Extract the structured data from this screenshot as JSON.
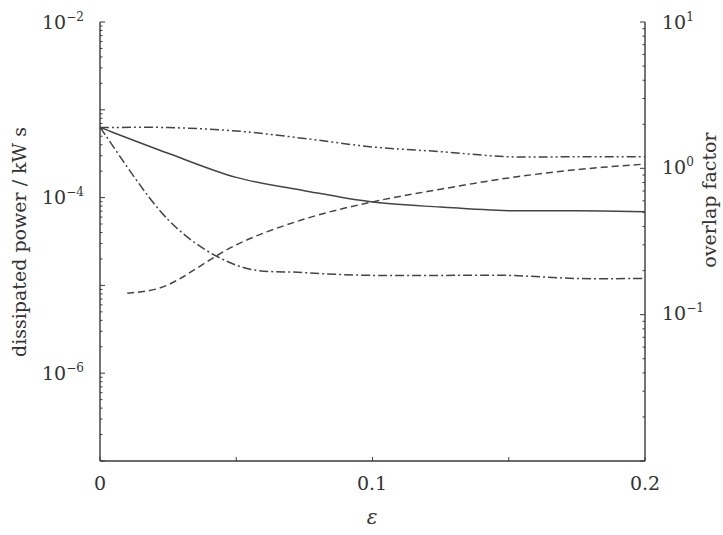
{
  "chart_data": {
    "type": "line",
    "title": "",
    "xlabel": "ε",
    "ylabel": "dissipated power / kW s",
    "ylabel_right": "overlap factor",
    "xlim": [
      0,
      0.2
    ],
    "ylim": [
      1e-07,
      0.01
    ],
    "ylim_right": [
      0.01,
      10.0
    ],
    "yscale": "log",
    "yscale_right": "log",
    "grid": false,
    "legend": null,
    "x_ticks": [
      "0",
      "0.1",
      "0.2"
    ],
    "y_ticks": [
      {
        "base": "10",
        "exp": "-2"
      },
      {
        "base": "10",
        "exp": "-4"
      },
      {
        "base": "10",
        "exp": "-6"
      }
    ],
    "y_ticks_right": [
      {
        "base": "10",
        "exp": "1"
      },
      {
        "base": "10",
        "exp": "0"
      },
      {
        "base": "10",
        "exp": "-1"
      }
    ],
    "x": [
      0,
      0.025,
      0.05,
      0.075,
      0.1,
      0.125,
      0.15,
      0.175,
      0.2
    ],
    "series": [
      {
        "name": "solid",
        "axis": "left",
        "style": "solid",
        "values": [
          0.00063,
          0.00032,
          0.00017,
          0.00012,
          8.9e-05,
          7.8e-05,
          7.1e-05,
          7.1e-05,
          6.9e-05
        ]
      },
      {
        "name": "dash-dot",
        "axis": "left",
        "style": "dash-dot",
        "values": [
          0.00063,
          5.6e-05,
          1.7e-05,
          1.4e-05,
          1.3e-05,
          1.3e-05,
          1.3e-05,
          1.2e-05,
          1.2e-05
        ]
      },
      {
        "name": "dash-dot-dot",
        "axis": "right",
        "style": "dash-dot-dot",
        "values": [
          1.9,
          1.9,
          1.8,
          1.6,
          1.4,
          1.3,
          1.2,
          1.2,
          1.2
        ]
      },
      {
        "name": "dashed",
        "axis": "right",
        "style": "dashed",
        "x": [
          0.01,
          0.025,
          0.05,
          0.075,
          0.1,
          0.125,
          0.15,
          0.175,
          0.2
        ],
        "values": [
          0.14,
          0.16,
          0.3,
          0.45,
          0.59,
          0.72,
          0.86,
          0.98,
          1.07
        ]
      }
    ]
  },
  "labels": {
    "xlabel": "ε",
    "ylabel": "dissipated power / kW s",
    "ylabel_right": "overlap factor",
    "xtick_0": "0",
    "xtick_1": "0.1",
    "xtick_2": "0.2",
    "ytick_base": "10",
    "ytick_l0_exp": "−2",
    "ytick_l1_exp": "−4",
    "ytick_l2_exp": "−6",
    "ytick_r0_exp": "1",
    "ytick_r1_exp": "0",
    "ytick_r2_exp": "−1"
  },
  "colors": {
    "ink": "#444444",
    "axis": "#3a3a3a"
  }
}
